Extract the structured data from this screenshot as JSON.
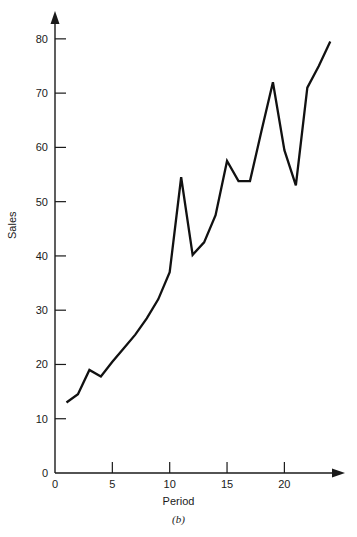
{
  "figure": {
    "panel_caption": "(b)",
    "ylabel": "Sales",
    "xlabel": "Period"
  },
  "chart_data": {
    "type": "line",
    "title": "",
    "subtitle": "",
    "xlabel": "Period",
    "ylabel": "Sales",
    "annotations": [
      "(b)"
    ],
    "legend": [],
    "legend_position": "none",
    "grid": false,
    "xlim": [
      0,
      24.5
    ],
    "ylim": [
      0,
      82
    ],
    "xticks": [
      0,
      5,
      10,
      15,
      20
    ],
    "xtick_labels": [
      "0",
      "5",
      "10",
      "15",
      "20"
    ],
    "yticks": [
      0,
      10,
      20,
      30,
      40,
      50,
      60,
      70,
      80
    ],
    "ytick_labels": [
      "0",
      "10",
      "20",
      "30",
      "40",
      "50",
      "60",
      "70",
      "80"
    ],
    "axis_arrows": true,
    "series": [
      {
        "name": "Sales",
        "color": "#111111",
        "x": [
          1,
          2,
          3,
          4,
          5,
          6,
          7,
          8,
          9,
          10,
          11,
          12,
          13,
          14,
          15,
          16,
          17,
          18,
          19,
          20,
          21,
          22,
          23,
          24
        ],
        "values": [
          13.0,
          14.5,
          19.0,
          17.8,
          20.5,
          23.0,
          25.5,
          28.5,
          32.0,
          37.0,
          54.5,
          40.2,
          42.5,
          47.5,
          57.5,
          53.8,
          53.8,
          63.0,
          72.0,
          59.5,
          53.0,
          71.0,
          75.0,
          79.5
        ]
      }
    ]
  }
}
